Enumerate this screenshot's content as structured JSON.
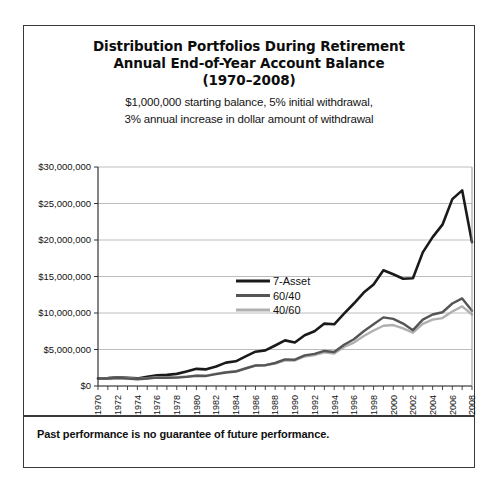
{
  "figure": {
    "title_lines": [
      "Distribution Portfolios During Retirement",
      "Annual End-of-Year Account Balance",
      "(1970–2008)"
    ],
    "subtitle_lines": [
      "$1,000,000 starting balance, 5% initial withdrawal,",
      "3% annual increase in dollar amount of withdrawal"
    ],
    "footer_note": "Past performance is no guarantee of future performance.",
    "border_color": "#3a3a3a",
    "background_color": "#ffffff"
  },
  "chart_data": {
    "type": "line",
    "title": "Distribution Portfolios During Retirement Annual End-of-Year Account Balance (1970–2008)",
    "subtitle": "$1,000,000 starting balance, 5% initial withdrawal, 3% annual increase in dollar amount of withdrawal",
    "xlabel": "",
    "ylabel": "",
    "ylim": [
      0,
      30000000
    ],
    "ytick_values": [
      0,
      5000000,
      10000000,
      15000000,
      20000000,
      25000000,
      30000000
    ],
    "ytick_labels": [
      "$0",
      "$5,000,000",
      "$10,000,000",
      "$15,000,000",
      "$20,000,000",
      "$25,000,000",
      "$30,000,000"
    ],
    "grid": true,
    "grid_color": "#b5b5b5",
    "legend_position": "center",
    "x": [
      1970,
      1971,
      1972,
      1973,
      1974,
      1975,
      1976,
      1977,
      1978,
      1979,
      1980,
      1981,
      1982,
      1983,
      1984,
      1985,
      1986,
      1987,
      1988,
      1989,
      1990,
      1991,
      1992,
      1993,
      1994,
      1995,
      1996,
      1997,
      1998,
      1999,
      2000,
      2001,
      2002,
      2003,
      2004,
      2005,
      2006,
      2007,
      2008
    ],
    "xtick_labels": [
      "1970",
      "1972",
      "1974",
      "1976",
      "1978",
      "1980",
      "1982",
      "1984",
      "1986",
      "1988",
      "1990",
      "1992",
      "1994",
      "1996",
      "1998",
      "2000",
      "2002",
      "2004",
      "2006",
      "2008"
    ],
    "xtick_step_years": 2,
    "minor_ticks_every_year": true,
    "series": [
      {
        "name": "7-Asset",
        "color": "#1a1a1a",
        "width": 2.6,
        "values": [
          1050000,
          1080000,
          1180000,
          1120000,
          1040000,
          1250000,
          1480000,
          1520000,
          1660000,
          2000000,
          2350000,
          2280000,
          2680000,
          3200000,
          3380000,
          4050000,
          4700000,
          4880000,
          5550000,
          6250000,
          5950000,
          6950000,
          7500000,
          8550000,
          8450000,
          9900000,
          11300000,
          12800000,
          13900000,
          15850000,
          15300000,
          14700000,
          14750000,
          18300000,
          20400000,
          22100000,
          25600000,
          26800000,
          19700000
        ]
      },
      {
        "name": "60/40",
        "color": "#555555",
        "width": 2.4,
        "values": [
          1020000,
          1030000,
          1100000,
          1030000,
          920000,
          1020000,
          1150000,
          1120000,
          1150000,
          1250000,
          1400000,
          1380000,
          1620000,
          1850000,
          1980000,
          2400000,
          2800000,
          2850000,
          3150000,
          3650000,
          3600000,
          4200000,
          4400000,
          4800000,
          4650000,
          5650000,
          6400000,
          7500000,
          8450000,
          9400000,
          9200000,
          8550000,
          7650000,
          9100000,
          9800000,
          10100000,
          11300000,
          12000000,
          10300000
        ]
      },
      {
        "name": "40/60",
        "color": "#b0b0b0",
        "width": 2.4,
        "values": [
          1030000,
          1050000,
          1120000,
          1060000,
          980000,
          1070000,
          1220000,
          1180000,
          1200000,
          1300000,
          1420000,
          1420000,
          1700000,
          1900000,
          2030000,
          2450000,
          2850000,
          2820000,
          3080000,
          3520000,
          3500000,
          4050000,
          4250000,
          4600000,
          4450000,
          5350000,
          5950000,
          6850000,
          7600000,
          8250000,
          8350000,
          7900000,
          7300000,
          8500000,
          9100000,
          9300000,
          10200000,
          10900000,
          9800000
        ]
      }
    ]
  }
}
